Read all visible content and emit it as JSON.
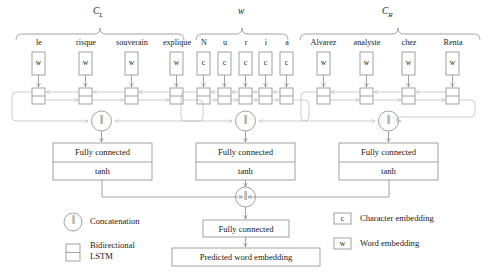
{
  "figure": {
    "type": "neural-network-architecture-diagram",
    "groups": [
      {
        "id": "left-context",
        "symbol": "C",
        "subscript": "L"
      },
      {
        "id": "target-word",
        "symbol": "w",
        "subscript": ""
      },
      {
        "id": "right-context",
        "symbol": "C",
        "subscript": "R"
      }
    ],
    "left_context": {
      "tokens": [
        "le",
        "risque",
        "souverain",
        "explique"
      ],
      "embedding_label": "w"
    },
    "target_word": {
      "tokens": [
        "N",
        "u",
        "r",
        "i",
        "a"
      ],
      "embedding_label": "c"
    },
    "right_context": {
      "tokens": [
        "Alvarez",
        "analyste",
        "chez",
        "Renta"
      ],
      "embedding_label": "w"
    },
    "fully_connected_blocks": [
      {
        "id": "fc-left",
        "line1": "Fully connected",
        "line2": "tanh"
      },
      {
        "id": "fc-middle",
        "line1": "Fully connected",
        "line2": "tanh"
      },
      {
        "id": "fc-right",
        "line1": "Fully connected",
        "line2": "tanh"
      }
    ],
    "output": {
      "fully_connected": "Fully connected",
      "predicted": "Predicted word embedding"
    },
    "legend": {
      "concatenation": "Concatenation",
      "bidirectional_line1": "Bidirectional",
      "bidirectional_line2": "LSTM",
      "char_symbol": "c",
      "char_label": "Character embedding",
      "word_symbol": "w",
      "word_label": "Word embedding",
      "concat_symbol": "‖"
    },
    "colors": {
      "stroke": "#6e6e6e",
      "stroke_light": "#a8a8a8",
      "text": "#1a1a1a",
      "background": "#ffffff"
    }
  }
}
